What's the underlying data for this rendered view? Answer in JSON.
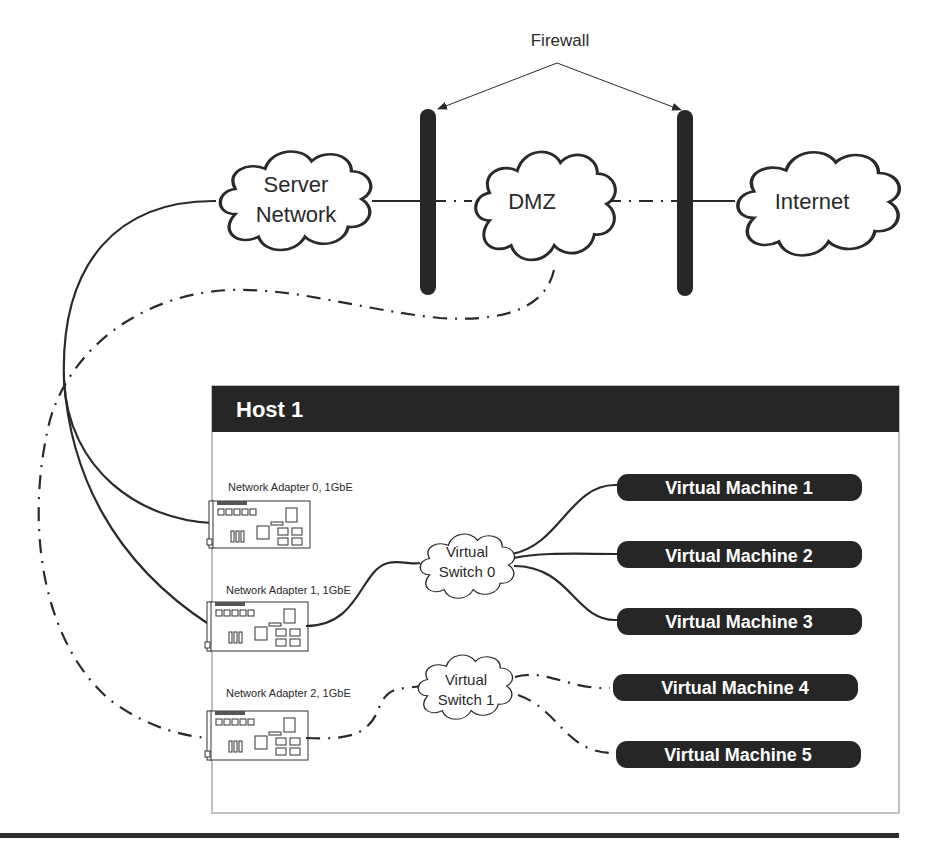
{
  "firewall": {
    "label": "Firewall"
  },
  "clouds": {
    "server_network": {
      "line1": "Server",
      "line2": "Network"
    },
    "dmz": {
      "label": "DMZ"
    },
    "internet": {
      "label": "Internet"
    }
  },
  "host": {
    "title": "Host 1",
    "adapters": [
      {
        "label": "Network Adapter 0, 1GbE"
      },
      {
        "label": "Network Adapter 1, 1GbE"
      },
      {
        "label": "Network Adapter 2, 1GbE"
      }
    ],
    "switches": [
      {
        "line1": "Virtual",
        "line2": "Switch 0"
      },
      {
        "line1": "Virtual",
        "line2": "Switch 1"
      }
    ],
    "vms": [
      {
        "label": "Virtual Machine 1"
      },
      {
        "label": "Virtual Machine 2"
      },
      {
        "label": "Virtual Machine 3"
      },
      {
        "label": "Virtual Machine 4"
      },
      {
        "label": "Virtual Machine 5"
      }
    ]
  },
  "colors": {
    "ink": "#2a2a2a",
    "bar": "#262626",
    "host_border": "#aaaaaa",
    "background": "#ffffff"
  }
}
